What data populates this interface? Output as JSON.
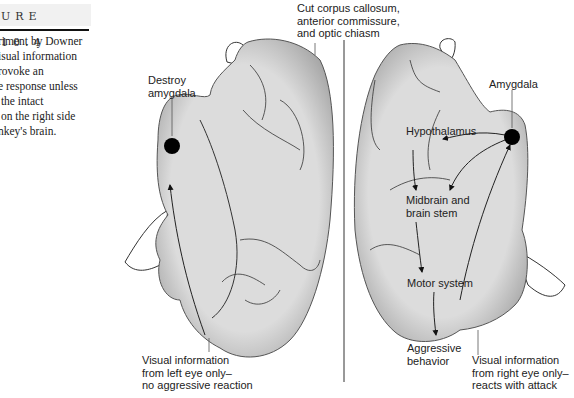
{
  "figure": {
    "heading": "URE 10.4",
    "caption_lines": [
      "riment by Downer",
      "isual information",
      "rovoke an",
      "e response unless",
      " the intact",
      " on the right side",
      "nkey's brain."
    ]
  },
  "labels": {
    "cut": "Cut corpus callosum,\nanterior commissure,\nand optic chiasm",
    "destroy_amygdala": "Destroy\namygdala",
    "left_visual": "Visual information\nfrom left eye only–\nno aggressive reaction",
    "amygdala": "Amygdala",
    "hypothalamus": "Hypothalamus",
    "midbrain": "Midbrain and\nbrain stem",
    "motor": "Motor system",
    "aggressive": "Aggressive\nbehavior",
    "right_visual": "Visual information\nfrom right eye only–\nreacts with attack"
  },
  "colors": {
    "brain_fill": "#d9d9d9",
    "outline": "#333333",
    "amygdala_dot": "#000000"
  }
}
